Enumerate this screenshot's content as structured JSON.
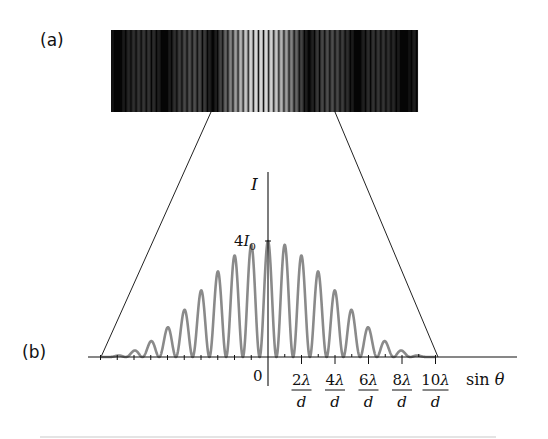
{
  "panels": {
    "a": {
      "label": "(a)",
      "description": "Photograph of double-slit interference fringes modulated by single-slit diffraction envelope"
    },
    "b": {
      "label": "(b)",
      "description": "Intensity versus sin theta"
    }
  },
  "axes": {
    "y_label": "I",
    "y_tick_label_main": "4I",
    "y_tick_label_sub": "0",
    "origin_label": "0",
    "x_label": "sin θ",
    "x_ticks": [
      {
        "num": "2λ",
        "den": "d"
      },
      {
        "num": "4λ",
        "den": "d"
      },
      {
        "num": "6λ",
        "den": "d"
      },
      {
        "num": "8λ",
        "den": "d"
      },
      {
        "num": "10λ",
        "den": "d"
      }
    ]
  },
  "colors": {
    "curve": "#8a8a8a",
    "axis": "#111111",
    "fringe_dark": "#050505",
    "fringe_bright": "#c8c8c8"
  },
  "chart_data": {
    "type": "line",
    "title": "",
    "xlabel": "sin θ (in units of λ/d)",
    "ylabel": "I (in units of I0)",
    "xlim": [
      -10,
      15
    ],
    "ylim": [
      0,
      4
    ],
    "grid": false,
    "legend": [],
    "peaks": {
      "x": [
        -10,
        -9,
        -8,
        -7,
        -6,
        -5,
        -4,
        -3,
        -2,
        -1,
        0,
        1,
        2,
        3,
        4,
        5,
        6,
        7,
        8,
        9,
        10
      ],
      "y": [
        0.0,
        0.05,
        0.1,
        0.4,
        0.9,
        1.5,
        2.1,
        2.7,
        3.2,
        3.6,
        4.0,
        3.6,
        3.2,
        2.7,
        2.1,
        1.5,
        0.9,
        0.4,
        0.1,
        0.05,
        0.0
      ]
    },
    "annotations": [
      "4I0 at peak of central maximum"
    ]
  }
}
